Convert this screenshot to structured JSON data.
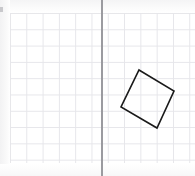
{
  "canvas": {
    "width": 195,
    "height": 176,
    "background_color": "#ffffff",
    "description": "Graph paper worksheet with a rotated square drawn to the right of a vertical axis line"
  },
  "grid": {
    "origin_x": 10,
    "origin_y": 13,
    "width": 185,
    "height": 150,
    "cell_size": 16.3,
    "line_color": "#e6e6ea",
    "columns": 11,
    "rows": 9
  },
  "axis": {
    "type": "vertical-line",
    "x": 101,
    "y_start": 0,
    "y_end": 176,
    "color": "#9b9ba0",
    "thickness": 1.6
  },
  "shape": {
    "name": "rotated-square",
    "type": "polygon",
    "stroke_color": "#1a1a1a",
    "stroke_width": 1.6,
    "fill": "none",
    "vertices": [
      {
        "label": "top",
        "x": 139,
        "y": 70
      },
      {
        "label": "right",
        "x": 174,
        "y": 91
      },
      {
        "label": "bottom",
        "x": 157,
        "y": 128
      },
      {
        "label": "left",
        "x": 121,
        "y": 107
      }
    ],
    "points_attr": "139,70 174,91 157,128 121,107",
    "side_length_px": 41,
    "rotation_degrees": 31
  },
  "artifacts": {
    "corner_mark_color": "#b9b9bd",
    "paper_tint_color": "#f4f4f5"
  }
}
